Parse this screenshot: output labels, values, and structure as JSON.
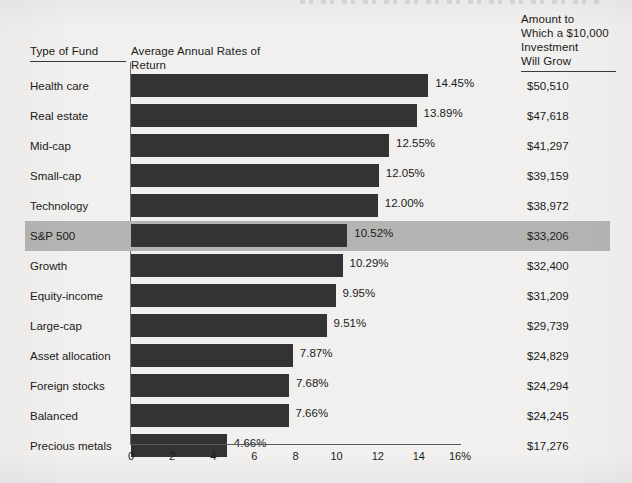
{
  "headers": {
    "type_of_fund": "Type of Fund",
    "rates": "Average Annual Rates of Return",
    "amount": "Amount to\nWhich a $10,000\nInvestment\nWill Grow"
  },
  "colors": {
    "background": "#f1f0ee",
    "bar": "#333333",
    "highlight_row": "#b4b4b3",
    "axis": "#5a5a5a",
    "text": "#1b1b1b"
  },
  "highlighted_fund": "S&P 500",
  "chart_data": {
    "type": "bar",
    "orientation": "horizontal",
    "title": "Average Annual Rates of Return",
    "xlabel": "",
    "ylabel": "Type of Fund",
    "xlim": [
      0,
      16
    ],
    "xticks": [
      0,
      2,
      4,
      6,
      8,
      10,
      12,
      14,
      16
    ],
    "xticklabels": [
      "0",
      "2",
      "4",
      "6",
      "8",
      "10",
      "12",
      "14",
      "16%"
    ],
    "grid": false,
    "legend": null,
    "categories": [
      "Health care",
      "Real estate",
      "Mid-cap",
      "Small-cap",
      "Technology",
      "S&P 500",
      "Growth",
      "Equity-income",
      "Large-cap",
      "Asset allocation",
      "Foreign stocks",
      "Balanced",
      "Precious metals"
    ],
    "values": [
      14.45,
      13.89,
      12.55,
      12.05,
      12.0,
      10.52,
      10.29,
      9.95,
      9.51,
      7.87,
      7.68,
      7.66,
      4.66
    ],
    "value_labels": [
      "14.45%",
      "13.89%",
      "12.55%",
      "12.05%",
      "12.00%",
      "10.52%",
      "10.29%",
      "9.95%",
      "9.51%",
      "7.87%",
      "7.68%",
      "7.66%",
      "4.66%"
    ],
    "annotation_column": {
      "header": "Amount to Which a $10,000 Investment Will Grow",
      "values": [
        "$50,510",
        "$47,618",
        "$41,297",
        "$39,159",
        "$38,972",
        "$33,206",
        "$32,400",
        "$31,209",
        "$29,739",
        "$24,829",
        "$24,294",
        "$24,245",
        "$17,276"
      ]
    }
  },
  "rows": [
    {
      "fund": "Health care",
      "pct": 14.45,
      "pct_label": "14.45%",
      "amount": "$50,510",
      "highlight": false
    },
    {
      "fund": "Real estate",
      "pct": 13.89,
      "pct_label": "13.89%",
      "amount": "$47,618",
      "highlight": false
    },
    {
      "fund": "Mid-cap",
      "pct": 12.55,
      "pct_label": "12.55%",
      "amount": "$41,297",
      "highlight": false
    },
    {
      "fund": "Small-cap",
      "pct": 12.05,
      "pct_label": "12.05%",
      "amount": "$39,159",
      "highlight": false
    },
    {
      "fund": "Technology",
      "pct": 12.0,
      "pct_label": "12.00%",
      "amount": "$38,972",
      "highlight": false
    },
    {
      "fund": "S&P 500",
      "pct": 10.52,
      "pct_label": "10.52%",
      "amount": "$33,206",
      "highlight": true
    },
    {
      "fund": "Growth",
      "pct": 10.29,
      "pct_label": "10.29%",
      "amount": "$32,400",
      "highlight": false
    },
    {
      "fund": "Equity-income",
      "pct": 9.95,
      "pct_label": "9.95%",
      "amount": "$31,209",
      "highlight": false
    },
    {
      "fund": "Large-cap",
      "pct": 9.51,
      "pct_label": "9.51%",
      "amount": "$29,739",
      "highlight": false
    },
    {
      "fund": "Asset allocation",
      "pct": 7.87,
      "pct_label": "7.87%",
      "amount": "$24,829",
      "highlight": false
    },
    {
      "fund": "Foreign stocks",
      "pct": 7.68,
      "pct_label": "7.68%",
      "amount": "$24,294",
      "highlight": false
    },
    {
      "fund": "Balanced",
      "pct": 7.66,
      "pct_label": "7.66%",
      "amount": "$24,245",
      "highlight": false
    },
    {
      "fund": "Precious metals",
      "pct": 4.66,
      "pct_label": "4.66%",
      "amount": "$17,276",
      "highlight": false
    }
  ]
}
